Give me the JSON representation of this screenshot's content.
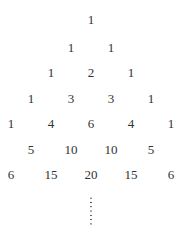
{
  "rows": [
    [
      1
    ],
    [
      1,
      1
    ],
    [
      1,
      2,
      1
    ],
    [
      1,
      3,
      3,
      1
    ],
    [
      1,
      4,
      6,
      4,
      1
    ],
    [
      1,
      5,
      10,
      10,
      5,
      1
    ],
    [
      1,
      6,
      15,
      20,
      15,
      6,
      1
    ]
  ],
  "continuation": "vertical-ellipsis"
}
